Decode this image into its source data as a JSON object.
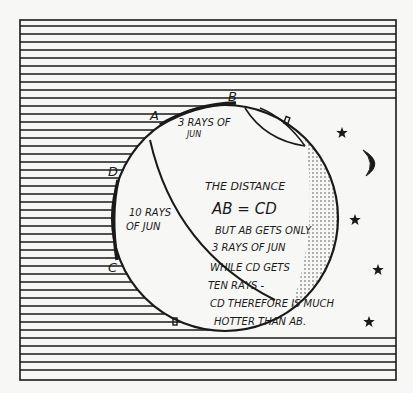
{
  "figure": {
    "width": 413,
    "height": 393,
    "colors": {
      "ink": "#1a1a1a",
      "paper": "#f7f7f5"
    },
    "frame": {
      "x": 20,
      "y": 20,
      "w": 376,
      "h": 360
    },
    "hatch": {
      "spacing": 8,
      "top_right_end_y": 102,
      "bottom_right_start_y": 336
    },
    "globe": {
      "cx": 225,
      "cy": 218,
      "r": 113
    }
  },
  "labels": {
    "point_a": "A",
    "point_b": "B",
    "point_c": "C",
    "point_d": "D",
    "region_ab_line1": "3 RAYS OF",
    "region_ab_line2": "JUN",
    "region_cd_line1": "10 RAYS",
    "region_cd_line2": "OF JUN"
  },
  "explanation": {
    "line1": "THE DISTANCE",
    "line2": "AB = CD",
    "line3": "BUT AB GETS ONLY",
    "line4": "3 RAYS OF JUN",
    "line5": "WHILE CD GETS",
    "line6": "TEN RAYS -",
    "line7": "CD THEREFORE IS MUCH",
    "line8": "HOTTER THAN AB."
  },
  "decorations": {
    "stars": [
      {
        "x": 342,
        "y": 133,
        "size": 6
      },
      {
        "x": 355,
        "y": 220,
        "size": 6
      },
      {
        "x": 378,
        "y": 270,
        "size": 6
      },
      {
        "x": 369,
        "y": 322,
        "size": 6
      }
    ],
    "moon": {
      "x": 368,
      "y": 160
    }
  }
}
